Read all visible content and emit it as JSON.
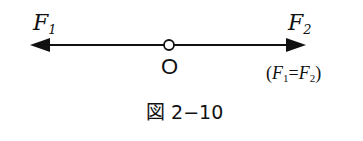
{
  "diagram": {
    "caption": "図 2−10",
    "labels": {
      "force_left": {
        "symbol": "F",
        "subscript": "1"
      },
      "force_right": {
        "symbol": "F",
        "subscript": "2"
      },
      "origin": "O",
      "condition": {
        "open": "(",
        "left_symbol": "F",
        "left_sub": "1",
        "equals": "=",
        "right_symbol": "F",
        "right_sub": "2",
        "close": ")"
      }
    },
    "geometry": {
      "line_y": 45,
      "origin_x": 169,
      "left_tip_x": 30,
      "right_tip_x": 306
    },
    "colors": {
      "ink": "#111111",
      "background": "#ffffff"
    }
  }
}
